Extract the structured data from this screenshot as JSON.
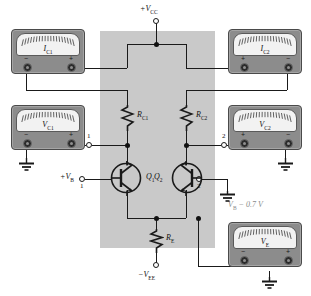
{
  "figure": {
    "type": "circuit-schematic"
  },
  "supplies": {
    "vcc": "+V",
    "vcc_sub": "CC",
    "vee": "−V",
    "vee_sub": "EE"
  },
  "meters": [
    {
      "id": "ic1",
      "label": "I",
      "sub": "C1",
      "left_sign": "−",
      "right_sign": "+",
      "ground": "none"
    },
    {
      "id": "ic2",
      "label": "I",
      "sub": "C2",
      "left_sign": "+",
      "right_sign": "−",
      "ground": "none"
    },
    {
      "id": "vc1",
      "label": "V",
      "sub": "C1",
      "left_sign": "−",
      "right_sign": "+",
      "ground": "left"
    },
    {
      "id": "vc2",
      "label": "V",
      "sub": "C2",
      "left_sign": "+",
      "right_sign": "−",
      "ground": "right"
    },
    {
      "id": "ve",
      "label": "V",
      "sub": "E",
      "left_sign": "−",
      "right_sign": "+",
      "ground": "right"
    }
  ],
  "components": {
    "rc1": {
      "label": "R",
      "sub": "C1"
    },
    "rc2": {
      "label": "R",
      "sub": "C2"
    },
    "re": {
      "label": "R",
      "sub": "E"
    },
    "q1": {
      "label": "Q",
      "sub": "1"
    },
    "q2": {
      "label": "Q",
      "sub": "2"
    }
  },
  "terminals": {
    "collector1_num": "1",
    "collector2_num": "2",
    "base1_label": "+V",
    "base1_sub": "B",
    "base1_num": "1",
    "base2_num": "2"
  },
  "annotations": {
    "ve_value": "V",
    "ve_value_sub": "B",
    "ve_value_rest": " − 0.7 V"
  },
  "colors": {
    "panel": "#c9c9c9",
    "meter_body": "#8c8c8c",
    "meter_face": "#f2f2f2",
    "wire": "#1a1a1a",
    "annotation_gray": "#8a8a8a"
  }
}
